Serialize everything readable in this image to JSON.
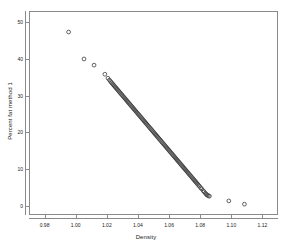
{
  "chart_data": {
    "type": "scatter",
    "title": "",
    "xlabel": "Density",
    "ylabel": "Percent fat method 1",
    "xlim": [
      0.97,
      1.13
    ],
    "ylim": [
      -2.5,
      53
    ],
    "grid": false,
    "legend": null,
    "marker": "open-circle",
    "marker_color": "#3a3a3a",
    "xticks": [
      0.98,
      1.0,
      1.02,
      1.04,
      1.06,
      1.08,
      1.1,
      1.12
    ],
    "xtick_labels": [
      "0.98",
      "1.00",
      "1.02",
      "1.04",
      "1.06",
      "1.08",
      "1.10",
      "1.12"
    ],
    "yticks": [
      0,
      10,
      20,
      30,
      40,
      50
    ],
    "ytick_labels": [
      "0",
      "10",
      "20",
      "30",
      "40",
      "50"
    ],
    "points": [
      [
        0.995,
        47.5
      ],
      [
        1.005,
        40.1
      ],
      [
        1.0115,
        38.4
      ],
      [
        1.0185,
        35.9
      ],
      [
        1.0205,
        34.8
      ],
      [
        1.0215,
        34.3
      ],
      [
        1.0222,
        33.9
      ],
      [
        1.0228,
        33.6
      ],
      [
        1.0234,
        33.3
      ],
      [
        1.024,
        33.0
      ],
      [
        1.0246,
        32.7
      ],
      [
        1.0252,
        32.4
      ],
      [
        1.0258,
        32.1
      ],
      [
        1.0264,
        31.8
      ],
      [
        1.027,
        31.5
      ],
      [
        1.0276,
        31.2
      ],
      [
        1.0282,
        30.9
      ],
      [
        1.0288,
        30.6
      ],
      [
        1.0294,
        30.3
      ],
      [
        1.03,
        30.0
      ],
      [
        1.0306,
        29.7
      ],
      [
        1.0312,
        29.4
      ],
      [
        1.0318,
        29.1
      ],
      [
        1.0324,
        28.8
      ],
      [
        1.033,
        28.5
      ],
      [
        1.0336,
        28.2
      ],
      [
        1.0342,
        27.9
      ],
      [
        1.0348,
        27.6
      ],
      [
        1.0354,
        27.3
      ],
      [
        1.036,
        27.0
      ],
      [
        1.0366,
        26.7
      ],
      [
        1.0372,
        26.4
      ],
      [
        1.0378,
        26.1
      ],
      [
        1.0384,
        25.8
      ],
      [
        1.039,
        25.5
      ],
      [
        1.0396,
        25.2
      ],
      [
        1.0402,
        24.9
      ],
      [
        1.0408,
        24.6
      ],
      [
        1.0414,
        24.3
      ],
      [
        1.042,
        24.0
      ],
      [
        1.0426,
        23.7
      ],
      [
        1.0432,
        23.4
      ],
      [
        1.0438,
        23.1
      ],
      [
        1.0444,
        22.8
      ],
      [
        1.045,
        22.5
      ],
      [
        1.0456,
        22.2
      ],
      [
        1.0462,
        21.9
      ],
      [
        1.0468,
        21.6
      ],
      [
        1.0474,
        21.3
      ],
      [
        1.048,
        21.0
      ],
      [
        1.0486,
        20.7
      ],
      [
        1.0492,
        20.4
      ],
      [
        1.0498,
        20.1
      ],
      [
        1.0504,
        19.8
      ],
      [
        1.051,
        19.5
      ],
      [
        1.0516,
        19.2
      ],
      [
        1.0522,
        18.9
      ],
      [
        1.0528,
        18.6
      ],
      [
        1.0534,
        18.3
      ],
      [
        1.054,
        18.0
      ],
      [
        1.0546,
        17.7
      ],
      [
        1.0552,
        17.4
      ],
      [
        1.0558,
        17.1
      ],
      [
        1.0564,
        16.8
      ],
      [
        1.057,
        16.5
      ],
      [
        1.0576,
        16.2
      ],
      [
        1.0582,
        15.9
      ],
      [
        1.0588,
        15.6
      ],
      [
        1.0594,
        15.3
      ],
      [
        1.06,
        15.0
      ],
      [
        1.0606,
        14.7
      ],
      [
        1.0612,
        14.4
      ],
      [
        1.0618,
        14.1
      ],
      [
        1.0624,
        13.8
      ],
      [
        1.063,
        13.5
      ],
      [
        1.0636,
        13.2
      ],
      [
        1.0642,
        12.9
      ],
      [
        1.0648,
        12.6
      ],
      [
        1.0654,
        12.3
      ],
      [
        1.066,
        12.0
      ],
      [
        1.0666,
        11.7
      ],
      [
        1.0672,
        11.4
      ],
      [
        1.0678,
        11.1
      ],
      [
        1.0684,
        10.8
      ],
      [
        1.069,
        10.5
      ],
      [
        1.0696,
        10.2
      ],
      [
        1.0702,
        9.9
      ],
      [
        1.0708,
        9.6
      ],
      [
        1.0714,
        9.3
      ],
      [
        1.072,
        9.0
      ],
      [
        1.0726,
        8.7
      ],
      [
        1.0732,
        8.4
      ],
      [
        1.0738,
        8.1
      ],
      [
        1.0744,
        7.8
      ],
      [
        1.075,
        7.5
      ],
      [
        1.0756,
        7.2
      ],
      [
        1.0762,
        6.9
      ],
      [
        1.0768,
        6.6
      ],
      [
        1.0774,
        6.3
      ],
      [
        1.078,
        6.0
      ],
      [
        1.0786,
        5.7
      ],
      [
        1.0792,
        5.4
      ],
      [
        1.0798,
        5.1
      ],
      [
        1.0806,
        4.7
      ],
      [
        1.0812,
        4.4
      ],
      [
        1.0822,
        3.9
      ],
      [
        1.0828,
        3.6
      ],
      [
        1.0836,
        3.2
      ],
      [
        1.0842,
        2.9
      ],
      [
        1.0848,
        2.7
      ],
      [
        1.0855,
        2.5
      ],
      [
        1.0862,
        2.4
      ],
      [
        1.0988,
        1.1
      ],
      [
        1.1089,
        0.2
      ]
    ]
  }
}
